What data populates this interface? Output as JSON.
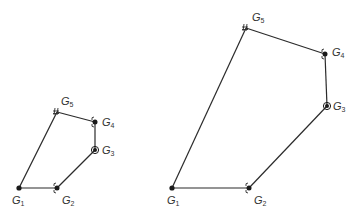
{
  "diagrams": [
    {
      "name": "small-polygon",
      "nodes": [
        {
          "id": "G1",
          "label": "G",
          "sub": "1",
          "x": 19,
          "y": 188,
          "marker": "dot",
          "lx": 12,
          "ly": 204
        },
        {
          "id": "G2",
          "label": "G",
          "sub": "2",
          "x": 57,
          "y": 188,
          "marker": "dot-brace",
          "lx": 62,
          "ly": 204
        },
        {
          "id": "G3",
          "label": "G",
          "sub": "3",
          "x": 95,
          "y": 150,
          "marker": "ring-dot",
          "lx": 102,
          "ly": 154
        },
        {
          "id": "G4",
          "label": "G",
          "sub": "4",
          "x": 95,
          "y": 122,
          "marker": "dot-brace",
          "lx": 102,
          "ly": 126
        },
        {
          "id": "G5",
          "label": "G",
          "sub": "5",
          "x": 57,
          "y": 112,
          "marker": "hash",
          "lx": 61,
          "ly": 105
        }
      ],
      "edges": [
        [
          "G1",
          "G2"
        ],
        [
          "G2",
          "G3"
        ],
        [
          "G3",
          "G4"
        ],
        [
          "G4",
          "G5"
        ],
        [
          "G5",
          "G1"
        ]
      ]
    },
    {
      "name": "large-polygon",
      "nodes": [
        {
          "id": "G1",
          "label": "G",
          "sub": "1",
          "x": 172,
          "y": 188,
          "marker": "dot",
          "lx": 167,
          "ly": 204
        },
        {
          "id": "G2",
          "label": "G",
          "sub": "2",
          "x": 249,
          "y": 188,
          "marker": "dot-brace",
          "lx": 254,
          "ly": 204
        },
        {
          "id": "G3",
          "label": "G",
          "sub": "3",
          "x": 327,
          "y": 106,
          "marker": "ring-dot",
          "lx": 333,
          "ly": 110
        },
        {
          "id": "G4",
          "label": "G",
          "sub": "4",
          "x": 325,
          "y": 54,
          "marker": "dot-brace",
          "lx": 332,
          "ly": 56
        },
        {
          "id": "G5",
          "label": "G",
          "sub": "5",
          "x": 246,
          "y": 28,
          "marker": "hash",
          "lx": 252,
          "ly": 21
        }
      ],
      "edges": [
        [
          "G1",
          "G2"
        ],
        [
          "G2",
          "G3"
        ],
        [
          "G3",
          "G4"
        ],
        [
          "G4",
          "G5"
        ],
        [
          "G5",
          "G1"
        ]
      ]
    }
  ],
  "labels": {
    "G1": "G1",
    "G2": "G2",
    "G3": "G3",
    "G4": "G4",
    "G5": "G5"
  }
}
